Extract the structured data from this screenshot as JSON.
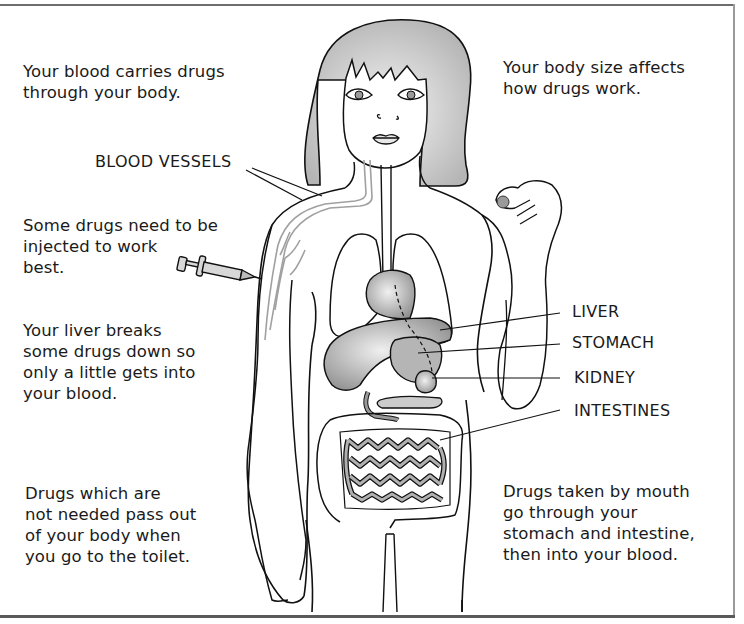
{
  "diagram": {
    "captions": {
      "blood_carries": [
        "Your blood carries drugs",
        "through your body."
      ],
      "body_size": [
        "Your body size affects",
        "how drugs work."
      ],
      "injected": [
        "Some drugs need to be",
        "injected to work",
        "best."
      ],
      "liver_breaks": [
        "Your liver breaks",
        "some drugs down so",
        "only a little gets into",
        "your blood."
      ],
      "pass_out": [
        "Drugs which are",
        "not needed pass out",
        "of your body when",
        "you go to the toilet."
      ],
      "by_mouth": [
        "Drugs taken by mouth",
        "go through your",
        "stomach and intestine,",
        "then into your blood."
      ]
    },
    "labels": {
      "blood_vessels": "BLOOD VESSELS",
      "liver": "LIVER",
      "stomach": "STOMACH",
      "kidney": "KIDNEY",
      "intestines": "INTESTINES"
    },
    "icons": [
      "syringe-icon",
      "pill-icon"
    ],
    "colors": {
      "outline": "#111111",
      "organ_fill": "#b8b8b8",
      "hair_fill": "#c9c9c9",
      "vessel": "#9c9c9c"
    }
  }
}
